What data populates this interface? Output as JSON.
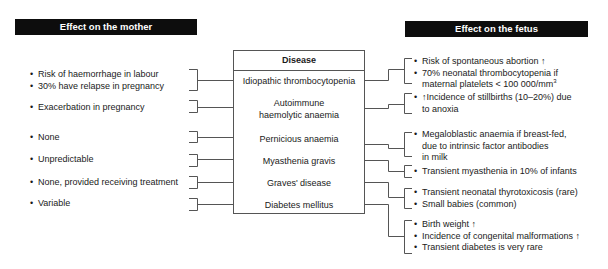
{
  "headers": {
    "mother": "Effect on the mother",
    "fetus": "Effect on the fetus"
  },
  "box": {
    "title": "Disease"
  },
  "diseases": [
    {
      "name": "Idiopathic thrombocytopenia"
    },
    {
      "name_line1": "Autoimmune",
      "name_line2": "haemolytic anaemia"
    },
    {
      "name": "Pernicious anaemia"
    },
    {
      "name": "Myasthenia gravis"
    },
    {
      "name": "Graves' disease"
    },
    {
      "name": "Diabetes mellitus"
    }
  ],
  "mother_effects": [
    [
      "Risk of haemorrhage in labour",
      "30% have relapse in pregnancy"
    ],
    [
      "Exacerbation in pregnancy"
    ],
    [
      "None"
    ],
    [
      "Unpredictable"
    ],
    [
      "None, provided receiving treatment"
    ],
    [
      "Variable"
    ]
  ],
  "fetus_effects": {
    "itp": {
      "b1": "Risk of spontaneous abortion ↑",
      "b2_line1": "70% neonatal thrombocytopenia if",
      "b2_line2": "maternal platelets < 100 000/mm",
      "b2_sup": "3"
    },
    "aiha": {
      "b1_line1": "↑Incidence of stillbirths (10–20%) due",
      "b1_line2": "to anoxia"
    },
    "pernicious": {
      "b1_line1": "Megaloblastic anaemia if breast-fed,",
      "b1_line2": "due to intrinsic factor antibodies",
      "b1_line3": "in milk"
    },
    "myasthenia": {
      "b1": "Transient myasthenia in 10% of infants"
    },
    "graves": {
      "b1": "Transient neonatal thyrotoxicosis (rare)",
      "b2": "Small babies (common)"
    },
    "diabetes": {
      "b1": "Birth weight ↑",
      "b2": "Incidence of congenital malformations ↑",
      "b3": "Transient diabetes is very rare"
    }
  },
  "bullet": "•",
  "colors": {
    "header_bg": "#0d0d0d",
    "header_text": "#ffffff",
    "line": "#555555",
    "text": "#1a1a1a"
  }
}
